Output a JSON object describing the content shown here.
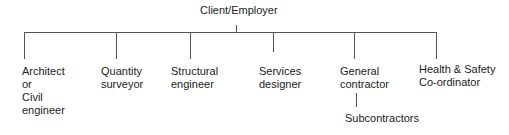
{
  "diagram": {
    "root": "Client/Employer",
    "children": [
      {
        "label": "Architect\nor\nCivil\nengineer"
      },
      {
        "label": "Quantity\nsurveyor"
      },
      {
        "label": "Structural\nengineer"
      },
      {
        "label": "Services\ndesigner"
      },
      {
        "label": "General\ncontractor",
        "child": "Subcontractors"
      },
      {
        "label": "Health & Safety\nCo-ordinator"
      }
    ]
  }
}
